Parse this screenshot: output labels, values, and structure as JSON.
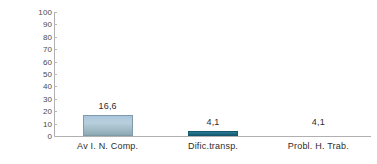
{
  "chart_data": {
    "type": "bar",
    "title": "",
    "subtitle": "",
    "xlabel": "",
    "ylabel": "% de pacientes",
    "categories": [
      "Av I. N. Comp.",
      "Dific.transp.",
      "Probl. H. Trab."
    ],
    "values": [
      16.6,
      4.1,
      4.1
    ],
    "data_labels": [
      "16,6",
      "4,1",
      "4,1"
    ],
    "series": [
      {
        "name": "% de pacientes",
        "values": [
          16.6,
          4.1,
          4.1
        ]
      }
    ],
    "ylim": [
      0,
      100
    ],
    "ytick_values": [
      0,
      10,
      20,
      30,
      40,
      50,
      60,
      70,
      80,
      90,
      100
    ],
    "ytick_labels": [
      "0",
      "10",
      "20",
      "30",
      "40",
      "50",
      "60",
      "70",
      "80",
      "90",
      "100"
    ],
    "grid": false,
    "legend": false,
    "legend_position": "none",
    "bar_colors": [
      "#a9c6dc",
      "#1d6a85",
      "#ffffff"
    ],
    "bars_drawn": [
      true,
      true,
      false
    ],
    "axis_color": "#b0b0b0",
    "background_color": "#ffffff",
    "text_color": "#2d2d2d"
  }
}
